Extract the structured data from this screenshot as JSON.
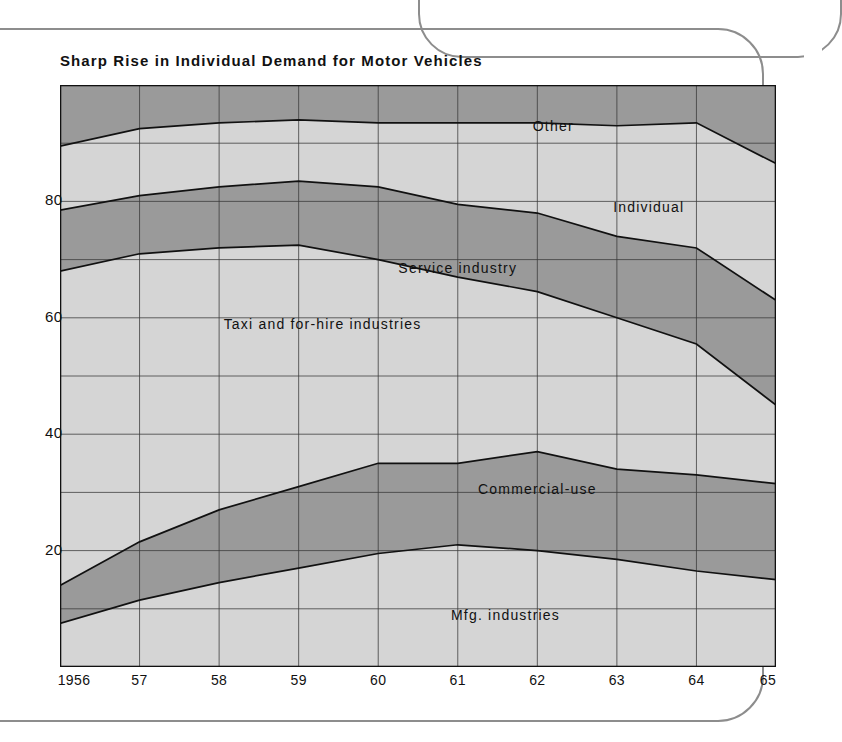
{
  "chart_title": "Sharp Rise in Individual Demand for Motor Vehicles",
  "axis_unit_label": "(%)",
  "colors": {
    "band_light": "#d5d5d5",
    "band_dark": "#9a9a9a",
    "grid": "#3a3a3a",
    "outline": "#111111",
    "frame": "#8d8d8d",
    "background": "#ffffff"
  },
  "chart_data": {
    "type": "area",
    "title": "Sharp Rise in Individual Demand for Motor Vehicles",
    "subtitle": "",
    "xlabel": "",
    "ylabel": "(%)",
    "stacked": true,
    "stack_total": 100,
    "grid": true,
    "legend_position": "inline-labels",
    "xlim": [
      1956,
      1965
    ],
    "ylim": [
      0,
      100
    ],
    "yticks": [
      20,
      40,
      60,
      80
    ],
    "ytick_labels": [
      "20",
      "40",
      "60",
      "80"
    ],
    "x": [
      1956,
      1957,
      1958,
      1959,
      1960,
      1961,
      1962,
      1963,
      1964,
      1965
    ],
    "xtick_labels": [
      "1956",
      "57",
      "58",
      "59",
      "60",
      "61",
      "62",
      "63",
      "64",
      "65"
    ],
    "series": [
      {
        "name": "Mfg. industries",
        "shade": "light",
        "values": [
          7.5,
          11.5,
          14.5,
          17.0,
          19.5,
          21.0,
          20.0,
          18.5,
          16.5,
          15.0
        ]
      },
      {
        "name": "Commercial-use",
        "shade": "dark",
        "values": [
          6.5,
          10.0,
          12.5,
          14.0,
          15.5,
          14.0,
          17.0,
          15.5,
          16.5,
          16.5
        ]
      },
      {
        "name": "Taxi and for-hire industries",
        "shade": "light",
        "values": [
          54.0,
          49.5,
          45.0,
          41.5,
          35.0,
          32.0,
          27.5,
          26.0,
          22.5,
          13.5
        ]
      },
      {
        "name": "Service industry",
        "shade": "dark",
        "values": [
          10.5,
          10.0,
          10.5,
          11.0,
          12.5,
          12.5,
          13.5,
          14.0,
          16.5,
          18.0
        ]
      },
      {
        "name": "Individual",
        "shade": "light",
        "values": [
          11.0,
          11.5,
          11.0,
          10.5,
          11.0,
          14.0,
          15.5,
          19.0,
          21.5,
          23.5
        ]
      },
      {
        "name": "Other",
        "shade": "dark",
        "values": [
          10.5,
          7.5,
          6.5,
          6.0,
          6.5,
          6.5,
          6.5,
          7.0,
          6.5,
          13.5
        ]
      }
    ],
    "band_labels": [
      {
        "text": "Other",
        "x": 1962.2,
        "y": 93.0
      },
      {
        "text": "Individual",
        "x": 1963.4,
        "y": 79.0
      },
      {
        "text": "Service industry",
        "x": 1961.0,
        "y": 68.5
      },
      {
        "text": "Taxi and for-hire industries",
        "x": 1959.3,
        "y": 59.0
      },
      {
        "text": "Commercial-use",
        "x": 1962.0,
        "y": 30.5
      },
      {
        "text": "Mfg. industries",
        "x": 1961.6,
        "y": 9.0
      }
    ]
  }
}
